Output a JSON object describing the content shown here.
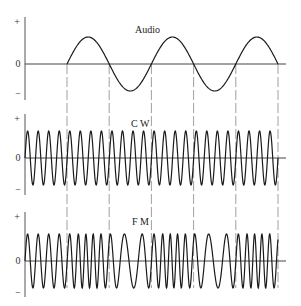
{
  "figure": {
    "panels": [
      {
        "id": "audio",
        "title": "Audio",
        "ticks": {
          "plus": "+",
          "zero": "0",
          "minus": "−"
        },
        "signal": "audio"
      },
      {
        "id": "cw",
        "title": "C W",
        "ticks": {
          "plus": "+",
          "zero": "0",
          "minus": "−"
        },
        "signal": "carrier"
      },
      {
        "id": "fm",
        "title": "F M",
        "ticks": {
          "plus": "+",
          "zero": "0",
          "minus": "−"
        },
        "signal": "frequency-modulated"
      }
    ],
    "signals": {
      "audio_cycles": 2.5,
      "audio_starts_after_carrier_fraction": 0.166,
      "carrier_cycles": 24,
      "fm_deviation_fraction": 0.45
    },
    "markers": {
      "description": "dashed verticals at audio zero crossings",
      "count": 6
    },
    "colors": {
      "wave": "#1a1a1a",
      "axis": "#555555",
      "dash": "#888888"
    }
  }
}
